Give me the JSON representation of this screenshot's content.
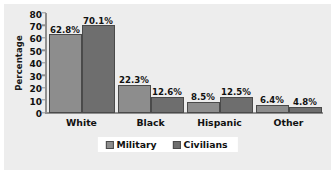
{
  "chart_data": {
    "type": "bar",
    "title": "",
    "xlabel": "",
    "ylabel": "Percentage",
    "categories": [
      "White",
      "Black",
      "Hispanic",
      "Other"
    ],
    "series": [
      {
        "name": "Military",
        "color": "#8d8d8d",
        "values": [
          62.8,
          22.3,
          8.5,
          6.4
        ],
        "labels": [
          "62.8%",
          "22.3%",
          "8.5%",
          "6.4%"
        ]
      },
      {
        "name": "Civilians",
        "color": "#6e6e6e",
        "values": [
          70.1,
          12.6,
          12.5,
          4.8
        ],
        "labels": [
          "70.1%",
          "12.6%",
          "12.5%",
          "4.8%"
        ]
      }
    ],
    "ylim": [
      0,
      80
    ],
    "yticks": [
      80,
      70,
      60,
      50,
      40,
      30,
      20,
      10,
      0
    ],
    "ytick_labels": [
      "80",
      "70",
      "60",
      "50",
      "40",
      "30",
      "20",
      "10",
      "0"
    ],
    "grid": false,
    "legend_position": "bottom",
    "plot_background": "#ededed",
    "axis_color": "#8f8f8f"
  }
}
